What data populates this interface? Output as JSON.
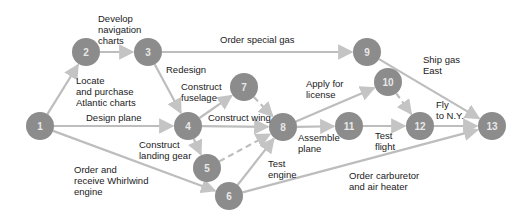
{
  "diagram": {
    "type": "network-activity-diagram",
    "colors": {
      "node_fill": "#8c8c8c",
      "node_text": "#e8e8e8",
      "edge": "#bdbdbd",
      "label_text": "#1a1a1a",
      "background": "#ffffff"
    },
    "nodes": [
      {
        "id": "1",
        "label": "1",
        "x": 40,
        "y": 126
      },
      {
        "id": "2",
        "label": "2",
        "x": 86,
        "y": 52
      },
      {
        "id": "3",
        "label": "3",
        "x": 148,
        "y": 52
      },
      {
        "id": "4",
        "label": "4",
        "x": 188,
        "y": 126
      },
      {
        "id": "5",
        "label": "5",
        "x": 207,
        "y": 168
      },
      {
        "id": "6",
        "label": "6",
        "x": 229,
        "y": 196
      },
      {
        "id": "7",
        "label": "7",
        "x": 244,
        "y": 87
      },
      {
        "id": "8",
        "label": "8",
        "x": 283,
        "y": 127
      },
      {
        "id": "9",
        "label": "9",
        "x": 367,
        "y": 52
      },
      {
        "id": "10",
        "label": "10",
        "x": 388,
        "y": 82
      },
      {
        "id": "11",
        "label": "11",
        "x": 349,
        "y": 126
      },
      {
        "id": "12",
        "label": "12",
        "x": 420,
        "y": 126
      },
      {
        "id": "13",
        "label": "13",
        "x": 492,
        "y": 126
      }
    ],
    "edges": [
      {
        "from": "1",
        "to": "2",
        "dashed": false
      },
      {
        "from": "2",
        "to": "3",
        "dashed": false
      },
      {
        "from": "3",
        "to": "9",
        "dashed": false
      },
      {
        "from": "3",
        "to": "4",
        "dashed": false
      },
      {
        "from": "1",
        "to": "4",
        "dashed": false
      },
      {
        "from": "1",
        "to": "6",
        "dashed": false
      },
      {
        "from": "4",
        "to": "7",
        "dashed": false
      },
      {
        "from": "4",
        "to": "8",
        "dashed": false
      },
      {
        "from": "4",
        "to": "5",
        "dashed": false
      },
      {
        "from": "7",
        "to": "8",
        "dashed": true
      },
      {
        "from": "5",
        "to": "8",
        "dashed": true
      },
      {
        "from": "6",
        "to": "8",
        "dashed": false
      },
      {
        "from": "6",
        "to": "13",
        "dashed": false
      },
      {
        "from": "8",
        "to": "10",
        "dashed": false
      },
      {
        "from": "8",
        "to": "11",
        "dashed": false
      },
      {
        "from": "11",
        "to": "12",
        "dashed": false
      },
      {
        "from": "10",
        "to": "12",
        "dashed": true
      },
      {
        "from": "12",
        "to": "13",
        "dashed": false
      },
      {
        "from": "9",
        "to": "13",
        "dashed": false
      }
    ],
    "labels": {
      "develop_nav_charts": "Develop\nnavigation\ncharts",
      "order_special_gas": "Order special gas",
      "redesign": "Redesign",
      "locate_purchase": "Locate\nand purchase\nAtlantic charts",
      "construct_fuselage": "Construct\nfuselage",
      "apply_license": "Apply for\nlicense",
      "ship_gas_east": "Ship gas\nEast",
      "design_plane": "Design plane",
      "construct_wing": "Construct wing",
      "fly_ny": "Fly\nto N.Y.",
      "construct_landing_gear": "Construct\nlanding gear",
      "assemble_plane": "Assemble\nplane",
      "test_flight": "Test\nflight",
      "order_engine": "Order and\nreceive Whirlwind\nengine",
      "test_engine": "Test\nengine",
      "order_carburetor": "Order carburetor\nand air heater"
    }
  }
}
